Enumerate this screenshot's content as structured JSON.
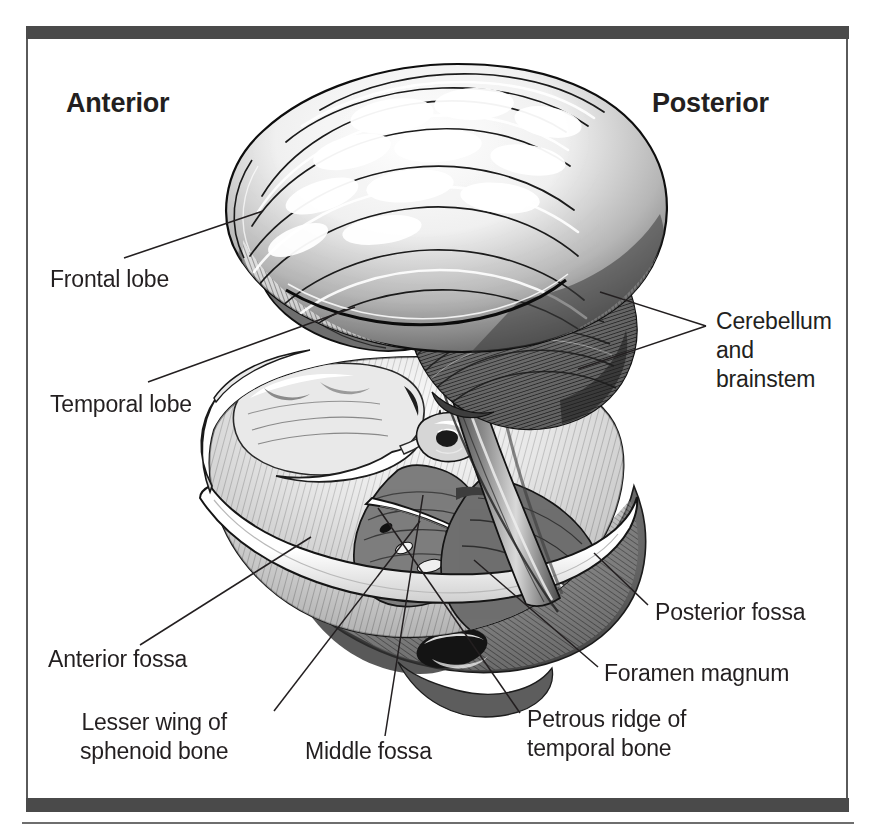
{
  "figure": {
    "type": "anatomical-illustration",
    "style": "black-and-white pen-and-ink medical illustration",
    "frame_color": "#4a4a4a",
    "text_color": "#231f20",
    "background_color": "#ffffff"
  },
  "orientation": {
    "anterior": "Anterior",
    "posterior": "Posterior"
  },
  "labels": {
    "frontal_lobe": "Frontal lobe",
    "temporal_lobe": "Temporal lobe",
    "cerebellum_and_brainstem": "Cerebellum\nand\nbrainstem",
    "anterior_fossa": "Anterior fossa",
    "lesser_wing_of_sphenoid_bone": "Lesser wing of\nsphenoid bone",
    "middle_fossa": "Middle fossa",
    "posterior_fossa": "Posterior fossa",
    "foramen_magnum": "Foramen magnum",
    "petrous_ridge_of_temporal_bone": "Petrous ridge of\ntemporal bone"
  },
  "leader_lines": [
    {
      "name": "frontal-lobe-leader",
      "points": "124,258 263,211"
    },
    {
      "name": "temporal-lobe-leader",
      "points": "148,382 355,307"
    },
    {
      "name": "cerebellum-leader-upper",
      "points": "706,326 600,292"
    },
    {
      "name": "cerebellum-leader-lower",
      "points": "706,326 578,369"
    },
    {
      "name": "anterior-fossa-leader",
      "points": "140,645 311,537"
    },
    {
      "name": "lesser-wing-leader",
      "points": "274,711 420,521"
    },
    {
      "name": "middle-fossa-leader",
      "points": "385,736 423,495"
    },
    {
      "name": "posterior-fossa-leader",
      "points": "648,605 594,553"
    },
    {
      "name": "foramen-magnum-leader",
      "points": "598,667 474,560"
    },
    {
      "name": "petrous-ridge-leader",
      "points": "520,713 378,508"
    }
  ]
}
